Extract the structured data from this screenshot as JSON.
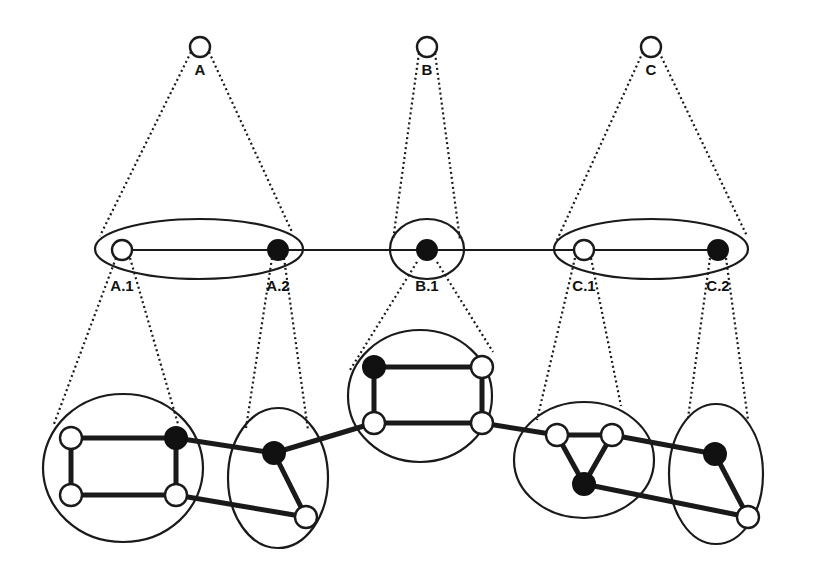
{
  "diagram": {
    "colors": {
      "stroke": "#1a1a1a",
      "filled_node": "#111111",
      "open_node": "#ffffff",
      "background": "#ffffff"
    },
    "top_level": {
      "nodes": [
        {
          "id": "A",
          "label": "A",
          "x": 200,
          "y": 47,
          "filled": false
        },
        {
          "id": "B",
          "label": "B",
          "x": 427,
          "y": 47,
          "filled": false
        },
        {
          "id": "C",
          "label": "C",
          "x": 651,
          "y": 47,
          "filled": false
        }
      ]
    },
    "middle_level": {
      "groups": [
        {
          "id": "A",
          "cx": 199,
          "cy": 249,
          "rx": 104,
          "ry": 30
        },
        {
          "id": "B",
          "cx": 427,
          "cy": 249,
          "rx": 37,
          "ry": 30
        },
        {
          "id": "C",
          "cx": 651,
          "cy": 249,
          "rx": 97,
          "ry": 30
        }
      ],
      "nodes": [
        {
          "id": "A.1",
          "label": "A.1",
          "x": 122,
          "y": 250,
          "filled": false
        },
        {
          "id": "A.2",
          "label": "A.2",
          "x": 278,
          "y": 250,
          "filled": true
        },
        {
          "id": "B.1",
          "label": "B.1",
          "x": 427,
          "y": 250,
          "filled": true
        },
        {
          "id": "C.1",
          "label": "C.1",
          "x": 584,
          "y": 250,
          "filled": false
        },
        {
          "id": "C.2",
          "label": "C.2",
          "x": 718,
          "y": 250,
          "filled": true
        }
      ],
      "edges": [
        [
          "A.1",
          "A.2"
        ],
        [
          "A.2",
          "B.1"
        ],
        [
          "B.1",
          "C.1"
        ],
        [
          "C.1",
          "C.2"
        ]
      ]
    },
    "bottom_level": {
      "clusters": [
        {
          "parent": "A.1",
          "shape": "circle",
          "cx": 123,
          "cy": 468,
          "rx": 80,
          "ry": 74
        },
        {
          "parent": "A.2",
          "shape": "ellipse",
          "cx": 278,
          "cy": 478,
          "rx": 50,
          "ry": 70
        },
        {
          "parent": "B.1",
          "shape": "circle",
          "cx": 420,
          "cy": 396,
          "rx": 72,
          "ry": 66
        },
        {
          "parent": "C.1",
          "shape": "circle",
          "cx": 584,
          "cy": 460,
          "rx": 70,
          "ry": 58
        },
        {
          "parent": "C.2",
          "shape": "ellipse",
          "cx": 716,
          "cy": 474,
          "rx": 47,
          "ry": 70
        }
      ],
      "nodes": [
        {
          "id": "a1",
          "x": 71,
          "y": 438,
          "filled": false
        },
        {
          "id": "a2",
          "x": 176,
          "y": 438,
          "filled": true
        },
        {
          "id": "a3",
          "x": 71,
          "y": 495,
          "filled": false
        },
        {
          "id": "a4",
          "x": 176,
          "y": 495,
          "filled": false
        },
        {
          "id": "b1",
          "x": 274,
          "y": 453,
          "filled": true
        },
        {
          "id": "b2",
          "x": 306,
          "y": 517,
          "filled": false
        },
        {
          "id": "c1",
          "x": 374,
          "y": 367,
          "filled": true
        },
        {
          "id": "c2",
          "x": 482,
          "y": 367,
          "filled": false
        },
        {
          "id": "c3",
          "x": 374,
          "y": 423,
          "filled": false
        },
        {
          "id": "c4",
          "x": 482,
          "y": 423,
          "filled": false
        },
        {
          "id": "d1",
          "x": 557,
          "y": 435,
          "filled": false
        },
        {
          "id": "d2",
          "x": 612,
          "y": 435,
          "filled": false
        },
        {
          "id": "d3",
          "x": 584,
          "y": 484,
          "filled": true
        },
        {
          "id": "e1",
          "x": 715,
          "y": 454,
          "filled": true
        },
        {
          "id": "e2",
          "x": 748,
          "y": 517,
          "filled": false
        }
      ],
      "edges": [
        [
          "a1",
          "a2"
        ],
        [
          "a1",
          "a3"
        ],
        [
          "a3",
          "a4"
        ],
        [
          "a2",
          "a4"
        ],
        [
          "a2",
          "b1"
        ],
        [
          "a4",
          "b2"
        ],
        [
          "b1",
          "b2"
        ],
        [
          "b1",
          "c3"
        ],
        [
          "c1",
          "c2"
        ],
        [
          "c1",
          "c3"
        ],
        [
          "c3",
          "c4"
        ],
        [
          "c2",
          "c4"
        ],
        [
          "c4",
          "d1"
        ],
        [
          "d1",
          "d2"
        ],
        [
          "d1",
          "d3"
        ],
        [
          "d2",
          "d3"
        ],
        [
          "d2",
          "e1"
        ],
        [
          "d3",
          "e2"
        ],
        [
          "e1",
          "e2"
        ]
      ]
    },
    "projection_lines": [
      [
        [
          191,
          52
        ],
        [
          100,
          236
        ]
      ],
      [
        [
          209,
          52
        ],
        [
          292,
          232
        ]
      ],
      [
        [
          419,
          53
        ],
        [
          393,
          240
        ]
      ],
      [
        [
          435,
          53
        ],
        [
          460,
          240
        ]
      ],
      [
        [
          643,
          52
        ],
        [
          557,
          240
        ]
      ],
      [
        [
          659,
          52
        ],
        [
          747,
          236
        ]
      ],
      [
        [
          116,
          258
        ],
        [
          54,
          424
        ]
      ],
      [
        [
          130,
          258
        ],
        [
          178,
          424
        ]
      ],
      [
        [
          272,
          258
        ],
        [
          246,
          428
        ]
      ],
      [
        [
          284,
          258
        ],
        [
          308,
          430
        ]
      ],
      [
        [
          417,
          262
        ],
        [
          350,
          370
        ]
      ],
      [
        [
          437,
          262
        ],
        [
          493,
          352
        ]
      ],
      [
        [
          575,
          258
        ],
        [
          537,
          420
        ]
      ],
      [
        [
          591,
          258
        ],
        [
          621,
          406
        ]
      ],
      [
        [
          710,
          258
        ],
        [
          688,
          418
        ]
      ],
      [
        [
          726,
          258
        ],
        [
          748,
          420
        ]
      ]
    ]
  }
}
